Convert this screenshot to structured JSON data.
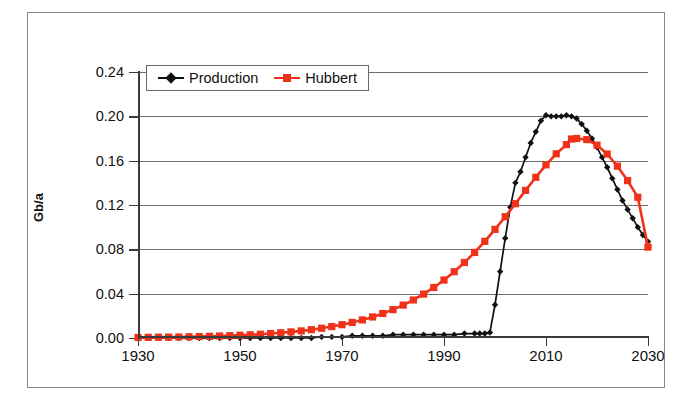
{
  "figure": {
    "ylabel": "Gb/a",
    "frame_color": "#8a8a8a",
    "background": "#ffffff"
  },
  "legend": {
    "position": "top-left-inside",
    "entries": [
      {
        "label": "Production",
        "color": "#111111",
        "marker": "diamond",
        "marker_name": "diamond-marker-icon"
      },
      {
        "label": "Hubbert",
        "color": "#EF3219",
        "marker": "square",
        "marker_name": "square-marker-icon"
      }
    ]
  },
  "chart_data": {
    "type": "line",
    "title": "",
    "subtitle": "",
    "xlabel": "",
    "ylabel": "Gb/a",
    "xlim": [
      1930,
      2030
    ],
    "ylim": [
      0.0,
      0.24
    ],
    "grid": true,
    "xticks": [
      1930,
      1950,
      1970,
      1990,
      2010,
      2030
    ],
    "xtick_labels": [
      "1930",
      "1950",
      "1970",
      "1990",
      "2010",
      "2030"
    ],
    "yticks": [
      0.0,
      0.04,
      0.08,
      0.12,
      0.16,
      0.2,
      0.24
    ],
    "ytick_labels": [
      "0.00",
      "0.04",
      "0.08",
      "0.12",
      "0.16",
      "0.20",
      "0.24"
    ],
    "legend_position": "upper left",
    "series": [
      {
        "name": "Production",
        "color": "#111111",
        "marker": "diamond",
        "x": [
          1930,
          1932,
          1934,
          1936,
          1938,
          1940,
          1942,
          1944,
          1946,
          1948,
          1950,
          1952,
          1954,
          1956,
          1958,
          1960,
          1962,
          1964,
          1966,
          1968,
          1970,
          1972,
          1974,
          1976,
          1978,
          1980,
          1982,
          1984,
          1986,
          1988,
          1990,
          1992,
          1994,
          1996,
          1997,
          1998,
          1999,
          2000,
          2001,
          2002,
          2003,
          2004,
          2005,
          2006,
          2007,
          2008,
          2009,
          2010,
          2011,
          2012,
          2013,
          2014,
          2015,
          2016,
          2017,
          2018,
          2019,
          2020,
          2021,
          2022,
          2023,
          2024,
          2025,
          2026,
          2027,
          2028,
          2029,
          2030
        ],
        "y": [
          0.0,
          0.0,
          0.0,
          0.0,
          0.0,
          0.0,
          0.0,
          0.0,
          0.0,
          0.0,
          0.0,
          0.0,
          0.0,
          0.0,
          0.0,
          0.0,
          0.0,
          0.0,
          0.001,
          0.001,
          0.001,
          0.002,
          0.002,
          0.002,
          0.002,
          0.003,
          0.003,
          0.003,
          0.003,
          0.003,
          0.003,
          0.003,
          0.004,
          0.004,
          0.004,
          0.004,
          0.005,
          0.03,
          0.06,
          0.09,
          0.118,
          0.14,
          0.15,
          0.163,
          0.176,
          0.186,
          0.196,
          0.201,
          0.2,
          0.2,
          0.2,
          0.201,
          0.2,
          0.198,
          0.193,
          0.187,
          0.18,
          0.172,
          0.163,
          0.154,
          0.144,
          0.134,
          0.124,
          0.116,
          0.108,
          0.1,
          0.093,
          0.087
        ]
      },
      {
        "name": "Hubbert",
        "color": "#EF3219",
        "marker": "square",
        "x": [
          1930,
          1932,
          1934,
          1936,
          1938,
          1940,
          1942,
          1944,
          1946,
          1948,
          1950,
          1952,
          1954,
          1956,
          1958,
          1960,
          1962,
          1964,
          1966,
          1968,
          1970,
          1972,
          1974,
          1976,
          1978,
          1980,
          1982,
          1984,
          1986,
          1988,
          1990,
          1992,
          1994,
          1996,
          1998,
          2000,
          2002,
          2004,
          2006,
          2008,
          2010,
          2012,
          2014,
          2015,
          2016,
          2018,
          2020,
          2022,
          2024,
          2026,
          2028,
          2030
        ],
        "y": [
          0.0005,
          0.0006,
          0.0007,
          0.0008,
          0.0009,
          0.0011,
          0.0013,
          0.0015,
          0.0018,
          0.0021,
          0.0025,
          0.0029,
          0.0034,
          0.004,
          0.0047,
          0.0055,
          0.0064,
          0.0075,
          0.0088,
          0.0103,
          0.012,
          0.014,
          0.0163,
          0.019,
          0.0221,
          0.0256,
          0.0297,
          0.0343,
          0.0396,
          0.0456,
          0.0523,
          0.0598,
          0.0681,
          0.0772,
          0.0872,
          0.098,
          0.1094,
          0.1212,
          0.1332,
          0.145,
          0.1562,
          0.1662,
          0.1745,
          0.1795,
          0.18,
          0.179,
          0.174,
          0.166,
          0.155,
          0.142,
          0.127,
          0.082
        ]
      }
    ]
  }
}
